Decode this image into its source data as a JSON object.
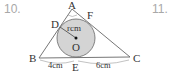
{
  "questions": {
    "left_number": "10.",
    "right_number": "11."
  },
  "diagram": {
    "points": {
      "A": "A",
      "B": "B",
      "C": "C",
      "D": "D",
      "E": "E",
      "F": "F",
      "O": "O"
    },
    "radius_label": "rcm",
    "segment_BE": "4cm",
    "segment_EC": "6cm",
    "colors": {
      "circle_fill": "#d4d4d4",
      "stroke": "#555555"
    }
  }
}
